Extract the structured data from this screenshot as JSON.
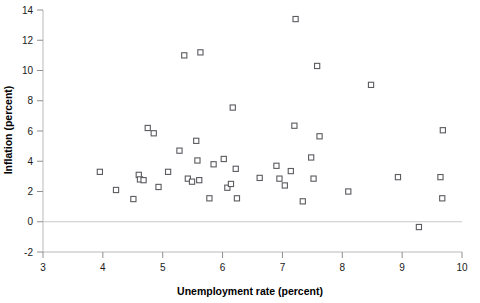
{
  "chart_data": {
    "type": "scatter",
    "title": "",
    "xlabel": "Unemployment rate (percent)",
    "ylabel": "Inflation (percent)",
    "xlim": [
      3,
      10
    ],
    "ylim": [
      -2,
      14
    ],
    "xticks": [
      3,
      4,
      5,
      6,
      7,
      8,
      9,
      10
    ],
    "xtick_labels": [
      "3",
      "4",
      "5",
      "6",
      "7",
      "8",
      "9",
      "10"
    ],
    "yticks": [
      -2,
      0,
      2,
      4,
      6,
      8,
      10,
      12,
      14
    ],
    "ytick_labels": [
      "-2",
      "0",
      "2",
      "4",
      "6",
      "8",
      "10",
      "12",
      "14"
    ],
    "grid": false,
    "legend": null,
    "marker": "open-square",
    "marker_color": "#5b5b60",
    "zero_line": true,
    "points": [
      {
        "x": 3.95,
        "y": 3.3
      },
      {
        "x": 4.22,
        "y": 2.1
      },
      {
        "x": 4.51,
        "y": 1.5
      },
      {
        "x": 4.6,
        "y": 3.1
      },
      {
        "x": 4.62,
        "y": 2.8
      },
      {
        "x": 4.68,
        "y": 2.75
      },
      {
        "x": 4.75,
        "y": 6.2
      },
      {
        "x": 4.85,
        "y": 5.85
      },
      {
        "x": 4.93,
        "y": 2.3
      },
      {
        "x": 5.09,
        "y": 3.3
      },
      {
        "x": 5.28,
        "y": 4.7
      },
      {
        "x": 5.36,
        "y": 11.0
      },
      {
        "x": 5.42,
        "y": 2.85
      },
      {
        "x": 5.49,
        "y": 2.65
      },
      {
        "x": 5.56,
        "y": 5.35
      },
      {
        "x": 5.58,
        "y": 4.05
      },
      {
        "x": 5.61,
        "y": 2.75
      },
      {
        "x": 5.63,
        "y": 11.2
      },
      {
        "x": 5.78,
        "y": 1.55
      },
      {
        "x": 5.85,
        "y": 3.8
      },
      {
        "x": 6.02,
        "y": 4.15
      },
      {
        "x": 6.08,
        "y": 2.25
      },
      {
        "x": 6.14,
        "y": 2.5
      },
      {
        "x": 6.17,
        "y": 7.55
      },
      {
        "x": 6.22,
        "y": 3.5
      },
      {
        "x": 6.24,
        "y": 1.55
      },
      {
        "x": 6.62,
        "y": 2.9
      },
      {
        "x": 6.9,
        "y": 3.7
      },
      {
        "x": 6.95,
        "y": 2.85
      },
      {
        "x": 7.04,
        "y": 2.4
      },
      {
        "x": 7.14,
        "y": 3.35
      },
      {
        "x": 7.2,
        "y": 6.35
      },
      {
        "x": 7.22,
        "y": 13.4
      },
      {
        "x": 7.34,
        "y": 1.35
      },
      {
        "x": 7.48,
        "y": 4.25
      },
      {
        "x": 7.52,
        "y": 2.85
      },
      {
        "x": 7.58,
        "y": 10.3
      },
      {
        "x": 7.62,
        "y": 5.65
      },
      {
        "x": 8.1,
        "y": 2.0
      },
      {
        "x": 8.48,
        "y": 9.05
      },
      {
        "x": 8.93,
        "y": 2.95
      },
      {
        "x": 9.28,
        "y": -0.35
      },
      {
        "x": 9.64,
        "y": 2.95
      },
      {
        "x": 9.67,
        "y": 1.55
      },
      {
        "x": 9.68,
        "y": 6.05
      }
    ]
  }
}
